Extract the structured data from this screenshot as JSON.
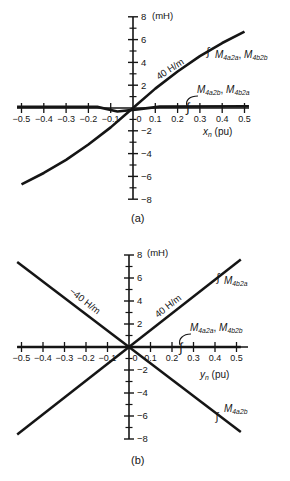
{
  "figure": {
    "ink": "#151515",
    "background": "#ffffff"
  },
  "chart_data": [
    {
      "id": "a",
      "type": "line",
      "caption": "(a)",
      "xlabel": "xn (pu)",
      "ylabel": "(mH)",
      "xlim": [
        -0.5,
        0.5
      ],
      "ylim": [
        -8,
        8
      ],
      "grid": false,
      "x_ticks": [
        -0.5,
        -0.4,
        -0.3,
        -0.2,
        -0.1,
        0,
        0.1,
        0.2,
        0.3,
        0.4,
        0.5
      ],
      "x_ticklabels": [
        "−0.5",
        "−0.4",
        "−0.3",
        "−0.2",
        "−0.1",
        "0",
        "0.1",
        "0.2",
        "0.3",
        "0.4",
        "0.5"
      ],
      "y_ticks": [
        8,
        6,
        4,
        2,
        -2,
        -4,
        -6,
        -8
      ],
      "y_ticklabels": [
        "8",
        "6",
        "4",
        "2",
        "−2",
        "−4",
        "−6",
        "−8"
      ],
      "y_minor_ticks": [
        7,
        5,
        3,
        1,
        -1,
        -3,
        -5,
        -7
      ],
      "series": [
        {
          "name": "M4a2a-M4b2b",
          "slope_label": "40 H/m",
          "w": 2.6,
          "x": [
            -0.5,
            -0.4,
            -0.3,
            -0.2,
            -0.1,
            0,
            0.1,
            0.2,
            0.3,
            0.4,
            0.5
          ],
          "y": [
            -6.7,
            -5.7,
            -4.55,
            -3.2,
            -1.7,
            0,
            1.7,
            3.2,
            4.55,
            5.7,
            6.7
          ]
        },
        {
          "name": "M4a2b-M4b2a",
          "w": 2.6,
          "x": [
            -0.52,
            -0.16,
            -0.07,
            0.02,
            0.12,
            0.52
          ],
          "y": [
            0.1,
            0.1,
            -0.3,
            -0.12,
            0.12,
            0.15
          ]
        }
      ],
      "annotations": [
        {
          "name": "y-axis-unit",
          "text": "(mH)",
          "x": 152,
          "y": 16,
          "size": 9.5
        },
        {
          "name": "slope-label",
          "text": "40 H/m",
          "x": 170,
          "y": 69,
          "rot": -33,
          "align": "center",
          "size": 9.5
        },
        {
          "name": "series-label-M4a2a-M4b2b",
          "text": "*M_{4a2a}*, *M_{4b2b}*",
          "x": 215,
          "y": 56,
          "size": 10
        },
        {
          "name": "series-label-M4a2b-M4b2a",
          "text": "*M_{4a2b}*, *M_{4b2a}*",
          "x": 197,
          "y": 91,
          "size": 10
        },
        {
          "name": "x-axis-label",
          "text": "*x_{n}* (pu)",
          "x": 203,
          "y": 133,
          "size": 10
        }
      ],
      "geom": {
        "origin": [
          133,
          108
        ],
        "px_per_unit_x": 223,
        "px_per_unit_y": 11.4,
        "x_axis": [
          17,
          249
        ],
        "y_axis": [
          17,
          199
        ],
        "height": 240
      },
      "layout": {
        "markers": [
          [
            208,
            51,
            11
          ],
          [
            188,
            107,
            13
          ]
        ],
        "leaders": [
          "M198,96 C190,96 185,100 187,106"
        ]
      }
    },
    {
      "id": "b",
      "type": "line",
      "caption": "(b)",
      "xlabel": "yn (pu)",
      "ylabel": "(mH)",
      "xlim": [
        -0.5,
        0.5
      ],
      "ylim": [
        -8,
        8
      ],
      "grid": false,
      "x_ticks": [
        -0.5,
        -0.4,
        -0.3,
        -0.2,
        -0.1,
        0,
        0.1,
        0.2,
        0.3,
        0.4,
        0.5
      ],
      "x_ticklabels": [
        "−0.5",
        "−0.4",
        "−0.3",
        "−0.2",
        "−0.1",
        "0",
        "0.1",
        "0.2",
        "0.3",
        "0.4",
        "0.5"
      ],
      "y_ticks": [
        8,
        6,
        4,
        2,
        -2,
        -4,
        -6,
        -8
      ],
      "y_ticklabels": [
        "8",
        "6",
        "4",
        "2",
        "−2",
        "−4",
        "−6",
        "−8"
      ],
      "y_minor_ticks": [
        7,
        5,
        3,
        1,
        -1,
        -3,
        -5,
        -7
      ],
      "series": [
        {
          "name": "M4b2a",
          "slope_label": "40 H/m",
          "w": 2.5,
          "x": [
            -0.52,
            0.52
          ],
          "y": [
            -7.6,
            7.6
          ]
        },
        {
          "name": "M4a2b",
          "slope_label": "−40 H/m",
          "w": 2.5,
          "x": [
            -0.52,
            0.52
          ],
          "y": [
            7.4,
            -7.4
          ]
        },
        {
          "name": "M4a2a-M4b2b",
          "w": 2.4,
          "x": [
            -0.52,
            0.52
          ],
          "y": [
            0,
            0
          ]
        }
      ],
      "annotations": [
        {
          "name": "y-axis-unit",
          "text": "(mH)",
          "x": 147,
          "y": 13,
          "size": 9.5
        },
        {
          "name": "slope-label-neg",
          "text": "−40 H/m",
          "x": 85,
          "y": 61,
          "rot": 38,
          "align": "center",
          "size": 9.5
        },
        {
          "name": "slope-label-pos",
          "text": "40 H/m",
          "x": 168,
          "y": 66,
          "rot": -38,
          "align": "center",
          "size": 9.5
        },
        {
          "name": "series-label-M4b2a",
          "text": "*M_{4b2a}*",
          "x": 224,
          "y": 42,
          "size": 10
        },
        {
          "name": "series-label-M4a2a-M4b2b",
          "text": "*M_{4a2a}*, *M_{4b2b}*",
          "x": 190,
          "y": 89,
          "size": 10
        },
        {
          "name": "x-axis-label",
          "text": "*y_{n}* (pu)",
          "x": 200,
          "y": 136,
          "size": 10
        },
        {
          "name": "series-label-M4a2b",
          "text": "*M_{4a2b}*",
          "x": 224,
          "y": 170,
          "size": 10
        }
      ],
      "geom": {
        "origin": [
          129,
          107
        ],
        "px_per_unit_x": 215,
        "px_per_unit_y": 11.5,
        "x_axis": [
          17,
          248
        ],
        "y_axis": [
          15,
          199
        ],
        "height": 241
      },
      "layout": {
        "markers": [
          [
            218,
            37,
            11
          ],
          [
            181,
            107,
            13
          ],
          [
            217,
            176,
            11
          ]
        ],
        "leaders": [
          "M191,94 C183,94 178,99 180,105"
        ]
      }
    }
  ]
}
